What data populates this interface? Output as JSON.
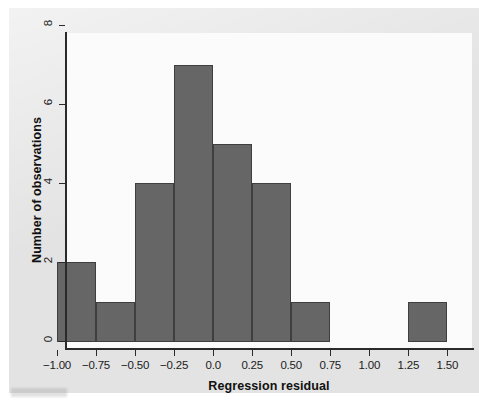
{
  "chart_data": {
    "type": "bar",
    "title": "",
    "subtitle": "",
    "xlabel": "Regression residual",
    "ylabel": "Number of observations",
    "xlim": [
      -1.0,
      1.6
    ],
    "ylim": [
      0,
      8
    ],
    "bin_width": 0.25,
    "grid": false,
    "legend": null,
    "bar_color": "#666666",
    "bar_edge_color": "#3f3f3f",
    "plot_background": "#fbfbfb",
    "panel_background": "#e3e3e3",
    "axis_color": "#2a2a2a",
    "xticks": [
      -1.0,
      -0.75,
      -0.5,
      -0.25,
      0.0,
      0.25,
      0.5,
      0.75,
      1.0,
      1.25,
      1.5
    ],
    "xticklabels": [
      "−1.00",
      "−0.75",
      "−0.50",
      "−0.25",
      "0.0",
      "0.25",
      "0.50",
      "0.75",
      "1.00",
      "1.25",
      "1.50"
    ],
    "yticks": [
      0,
      2,
      4,
      6,
      8
    ],
    "yticklabels": [
      "0",
      "2",
      "4",
      "6",
      "8"
    ],
    "bins": [
      {
        "left": -1.0,
        "right": -0.75,
        "count": 2
      },
      {
        "left": -0.75,
        "right": -0.5,
        "count": 1
      },
      {
        "left": -0.5,
        "right": -0.25,
        "count": 4
      },
      {
        "left": -0.25,
        "right": 0.0,
        "count": 7
      },
      {
        "left": 0.0,
        "right": 0.25,
        "count": 5
      },
      {
        "left": 0.25,
        "right": 0.5,
        "count": 4
      },
      {
        "left": 0.5,
        "right": 0.75,
        "count": 1
      },
      {
        "left": 0.75,
        "right": 1.0,
        "count": 0
      },
      {
        "left": 1.0,
        "right": 1.25,
        "count": 0
      },
      {
        "left": 1.25,
        "right": 1.5,
        "count": 1
      }
    ],
    "categories": [
      "-1.00 to -0.75",
      "-0.75 to -0.50",
      "-0.50 to -0.25",
      "-0.25 to 0.00",
      "0.00 to 0.25",
      "0.25 to 0.50",
      "0.50 to 0.75",
      "0.75 to 1.00",
      "1.00 to 1.25",
      "1.25 to 1.50"
    ],
    "values": [
      2,
      1,
      4,
      7,
      5,
      4,
      1,
      0,
      0,
      1
    ],
    "total_observations": 25
  }
}
